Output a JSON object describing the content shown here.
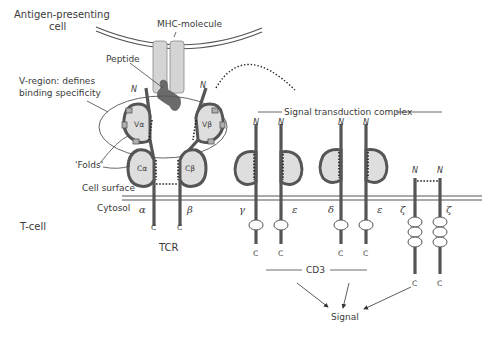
{
  "labels": {
    "apc": [
      "Antigen-presenting",
      "cell"
    ],
    "mhc": "MHC-molecule",
    "peptide": "Peptide",
    "v_region": [
      "V-region: defines",
      "binding specificity"
    ],
    "folds": "'Folds'",
    "cell_surface": "Cell surface",
    "cytosol": "Cytosol",
    "t_cell": "T-cell",
    "tcr": "TCR",
    "signal_complex": "Signal transduction complex",
    "cd3": "CD3",
    "signal": "Signal"
  },
  "domains": {
    "v_alpha": "Vα",
    "v_beta": "Vβ",
    "c_alpha": "Cα",
    "c_beta": "Cβ"
  },
  "chains": [
    {
      "id": "alpha",
      "greek": "α",
      "n": "N",
      "c": "C",
      "group": "TCR"
    },
    {
      "id": "beta",
      "greek": "β",
      "n": "N",
      "c": "C",
      "group": "TCR"
    },
    {
      "id": "gamma",
      "greek": "γ",
      "n": "N",
      "c": "C",
      "group": "CD3"
    },
    {
      "id": "epsilon1",
      "greek": "ε",
      "n": "N",
      "c": "C",
      "group": "CD3"
    },
    {
      "id": "delta",
      "greek": "δ",
      "n": "N",
      "c": "C",
      "group": "CD3"
    },
    {
      "id": "epsilon2",
      "greek": "ε",
      "n": "N",
      "c": "C",
      "group": "CD3"
    },
    {
      "id": "zeta1",
      "greek": "ζ",
      "n": "N",
      "c": "C",
      "group": "zeta"
    },
    {
      "id": "zeta2",
      "greek": "ζ",
      "n": "N",
      "c": "C",
      "group": "zeta"
    }
  ],
  "colors": {
    "chain": "#555555",
    "domain_fill": "#dedede",
    "peptide": "#6a6a6a",
    "mhc_fill": "#d4d4d4",
    "text": "#3a3a3a"
  }
}
